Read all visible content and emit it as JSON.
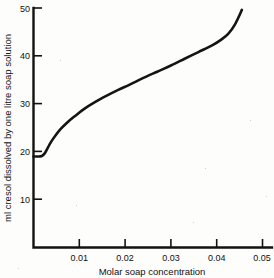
{
  "chart_data": {
    "type": "line",
    "title": "",
    "xlabel": "Molar soap concentration",
    "ylabel": "ml cresol dissolved by one litre soap solution",
    "xlim": [
      0,
      0.05
    ],
    "ylim": [
      0,
      50
    ],
    "xticks": [
      0.01,
      0.02,
      0.03,
      0.04,
      0.05
    ],
    "xtick_labels": [
      "0.01",
      "0.02",
      "0.03",
      "0.04",
      "0.05"
    ],
    "yticks": [
      10,
      20,
      30,
      40,
      50
    ],
    "ytick_labels": [
      "10",
      "20",
      "30",
      "40",
      "50"
    ],
    "grid": false,
    "legend": false,
    "series": [
      {
        "name": "cresol solubilised",
        "x": [
          0.0,
          0.001,
          0.0018,
          0.0024,
          0.003,
          0.0038,
          0.0048,
          0.006,
          0.0075,
          0.009,
          0.011,
          0.0135,
          0.016,
          0.0185,
          0.021,
          0.024,
          0.027,
          0.03,
          0.033,
          0.036,
          0.039,
          0.041,
          0.0425,
          0.044,
          0.0455
        ],
        "y": [
          19.0,
          19.0,
          19.1,
          19.6,
          20.6,
          22.0,
          23.4,
          24.8,
          26.2,
          27.4,
          28.9,
          30.4,
          31.7,
          32.9,
          34.0,
          35.4,
          36.7,
          38.0,
          39.4,
          40.8,
          42.2,
          43.4,
          44.6,
          46.6,
          49.6
        ]
      }
    ]
  },
  "figure": {
    "axis_color": "#121212",
    "curve_color": "#141414",
    "background_color": "#fdfdfc"
  }
}
